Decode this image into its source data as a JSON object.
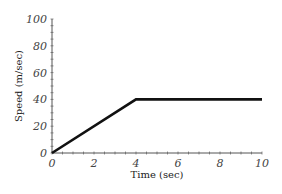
{
  "chart_data": {
    "type": "line",
    "title": "",
    "xlabel": "Time (sec)",
    "ylabel": "Speed (m/sec)",
    "xlim": [
      0,
      10
    ],
    "ylim": [
      0,
      100
    ],
    "xticks": [
      0,
      2,
      4,
      6,
      8,
      10
    ],
    "yticks": [
      0,
      20,
      40,
      60,
      80,
      100
    ],
    "grid": false,
    "legend": null,
    "series": [
      {
        "name": "speed",
        "color": "#111111",
        "x": [
          0,
          4,
          10
        ],
        "y": [
          0,
          40,
          40
        ]
      }
    ]
  },
  "labels": {
    "xlabel": "Time (sec)",
    "ylabel": "Speed (m/sec)",
    "xticks": [
      "0",
      "2",
      "4",
      "6",
      "8",
      "10"
    ],
    "yticks": [
      "0",
      "20",
      "40",
      "60",
      "80",
      "100"
    ]
  }
}
